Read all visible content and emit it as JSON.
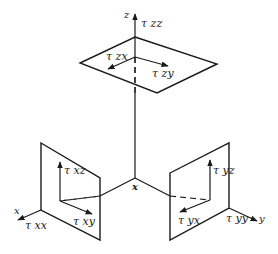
{
  "diagram": {
    "axes": {
      "z": "z",
      "x": "x",
      "y": "y",
      "origin": "x"
    },
    "top_plane": {
      "normal": "τ zz",
      "shear_x": "τ zx",
      "shear_y": "τ zy"
    },
    "left_plane": {
      "normal": "τ xx",
      "shear_z": "τ xz",
      "shear_y": "τ xy"
    },
    "right_plane": {
      "normal": "τ yy",
      "shear_z": "τ yz",
      "shear_x": "τ yx"
    },
    "colors": {
      "line": "#1a1a1a",
      "background": "#ffffff"
    }
  }
}
